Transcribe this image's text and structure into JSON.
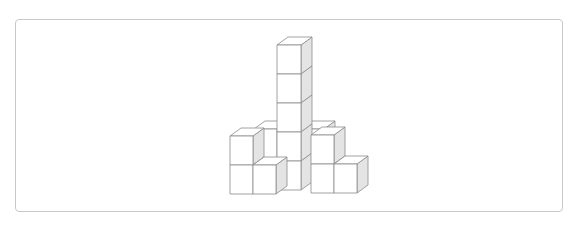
{
  "figure": {
    "type": "isometric-cube-stack",
    "cube_size_px": 23,
    "depth_offset": {
      "dx": 11,
      "dy": -8
    },
    "colors": {
      "edge": "#8a8a8a",
      "front_face": "#ffffff",
      "top_face": "#ffffff",
      "side_face": "#e4e4e4",
      "frame_border": "#c8c8c8"
    },
    "cubes": [
      {
        "id": "back-left",
        "x": 254,
        "y": 129,
        "h": 1
      },
      {
        "id": "back-right",
        "x": 301,
        "y": 129,
        "h": 1
      },
      {
        "id": "tower",
        "x": 277,
        "y": 45,
        "h": 5
      },
      {
        "id": "left-stack",
        "x": 230,
        "y": 136,
        "h": 2
      },
      {
        "id": "front-mid",
        "x": 253,
        "y": 165,
        "h": 1
      },
      {
        "id": "right-stack",
        "x": 311,
        "y": 135,
        "h": 2
      },
      {
        "id": "right-low",
        "x": 334,
        "y": 164,
        "h": 1
      }
    ]
  }
}
